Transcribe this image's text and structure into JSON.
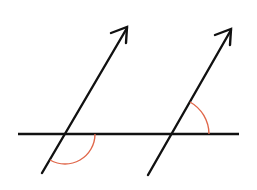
{
  "diagram": {
    "title": "",
    "colors": {
      "background": "#ffffff",
      "line": "#111111",
      "arc": "#e0674a"
    },
    "transversal": {
      "x1": 18,
      "y1": 134,
      "x2": 239,
      "y2": 134
    },
    "arrows": [
      {
        "id": "left-arrow",
        "x1": 42,
        "y1": 173,
        "x2": 127,
        "y2": 27
      },
      {
        "id": "right-arrow",
        "x1": 148,
        "y1": 175,
        "x2": 231,
        "y2": 29
      }
    ],
    "angle_marks": [
      {
        "id": "left-angle",
        "center": [
          65,
          134
        ],
        "radius": 30,
        "position": "below transversal, between right ray and lower-left ray"
      },
      {
        "id": "right-angle",
        "center": [
          172,
          134
        ],
        "radius": 37,
        "position": "above transversal, between right ray and upper ray"
      }
    ]
  }
}
